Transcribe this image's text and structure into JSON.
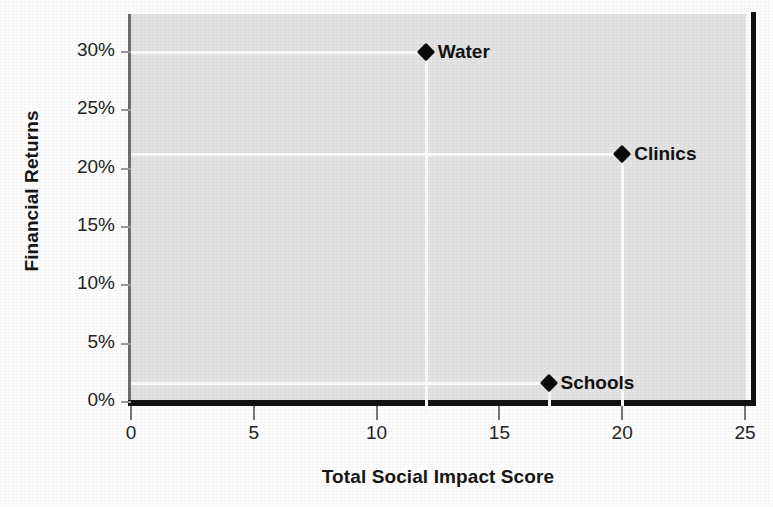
{
  "chart_data": {
    "type": "scatter",
    "title": "",
    "xlabel": "Total Social Impact Score",
    "ylabel": "Financial Returns",
    "xlim": [
      0,
      25
    ],
    "ylim": [
      0,
      32.5
    ],
    "xticks": [
      "0",
      "5",
      "10",
      "15",
      "20",
      "25"
    ],
    "xtick_values": [
      0,
      5,
      10,
      15,
      20,
      25
    ],
    "yticks": [
      "0%",
      "5%",
      "10%",
      "15%",
      "20%",
      "25%",
      "30%"
    ],
    "ytick_values": [
      0,
      5,
      10,
      15,
      20,
      25,
      30
    ],
    "grid": false,
    "legend": "none",
    "annotations": "each point has a white leader line to the x-axis and y-axis",
    "points": [
      {
        "label": "Water",
        "x": 12,
        "y": 30.0
      },
      {
        "label": "Clinics",
        "x": 20,
        "y": 21.3
      },
      {
        "label": "Schools",
        "x": 17,
        "y": 1.6
      }
    ],
    "colors": {
      "marker": "#0a0a0a",
      "plot_background": "#e3e3e3",
      "figure_background": "#fdfdfd",
      "leader_line": "#fbfbfb",
      "axis_spine": "#121212",
      "text": "#1a1a1a"
    }
  }
}
